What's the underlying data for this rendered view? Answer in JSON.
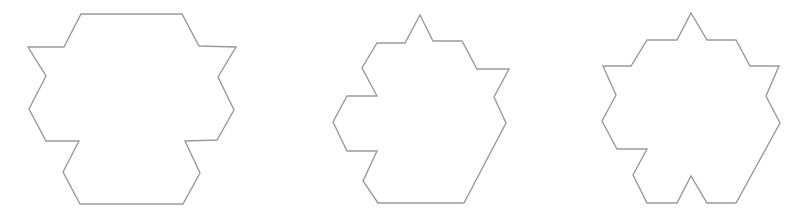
{
  "figure": {
    "width": 798,
    "height": 223,
    "background": "#ffffff",
    "stroke_color": "#9a9a9a",
    "stroke_width": 1.4,
    "shapes": [
      {
        "name": "shape-1-symmetric-hexagonal-polyform",
        "points": [
          [
            81,
            14
          ],
          [
            182,
            14
          ],
          [
            199,
            46
          ],
          [
            236,
            47
          ],
          [
            218,
            77
          ],
          [
            234,
            110
          ],
          [
            217,
            140
          ],
          [
            185,
            141
          ],
          [
            200,
            173
          ],
          [
            183,
            204
          ],
          [
            80,
            204
          ],
          [
            63,
            172
          ],
          [
            79,
            141
          ],
          [
            46,
            141
          ],
          [
            29,
            109
          ],
          [
            46,
            76
          ],
          [
            28,
            47
          ],
          [
            64,
            47
          ]
        ]
      },
      {
        "name": "shape-2-notched-hexagonal-polyform",
        "points": [
          [
            420,
            15
          ],
          [
            433,
            41
          ],
          [
            462,
            41
          ],
          [
            477,
            69
          ],
          [
            509,
            69
          ],
          [
            494,
            97
          ],
          [
            506,
            123
          ],
          [
            464,
            203
          ],
          [
            378,
            203
          ],
          [
            363,
            181
          ],
          [
            377,
            151
          ],
          [
            347,
            151
          ],
          [
            333,
            122
          ],
          [
            347,
            96
          ],
          [
            377,
            96
          ],
          [
            362,
            68
          ],
          [
            377,
            43
          ],
          [
            405,
            43
          ]
        ]
      },
      {
        "name": "shape-3-star-like-hexagonal-polyform",
        "points": [
          [
            691,
            13
          ],
          [
            707,
            40
          ],
          [
            736,
            40
          ],
          [
            750,
            66
          ],
          [
            779,
            66
          ],
          [
            766,
            96
          ],
          [
            780,
            123
          ],
          [
            736,
            203
          ],
          [
            707,
            203
          ],
          [
            691,
            176
          ],
          [
            677,
            203
          ],
          [
            647,
            203
          ],
          [
            633,
            175
          ],
          [
            647,
            149
          ],
          [
            617,
            149
          ],
          [
            602,
            121
          ],
          [
            616,
            95
          ],
          [
            603,
            66
          ],
          [
            631,
            66
          ],
          [
            647,
            40
          ],
          [
            677,
            40
          ]
        ]
      }
    ]
  }
}
